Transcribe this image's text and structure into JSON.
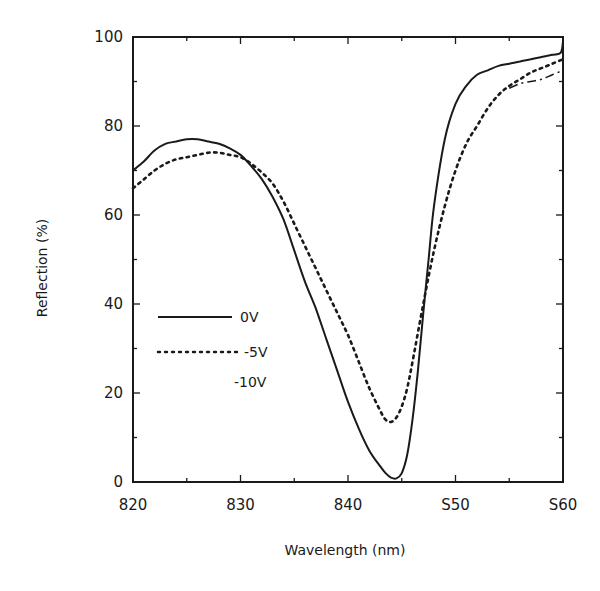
{
  "chart_data": {
    "type": "line",
    "title": "",
    "xlabel": "Wavelength (nm)",
    "ylabel": "Reflection (%)",
    "xlim": [
      820,
      860
    ],
    "ylim": [
      0,
      100
    ],
    "grid": false,
    "legend_position": "inside-left-middle",
    "x_ticks": [
      820,
      830,
      840,
      850,
      860
    ],
    "x_tick_labels": [
      "820",
      "830",
      "840",
      "S50",
      "S60"
    ],
    "y_ticks": [
      0,
      20,
      40,
      60,
      80,
      100
    ],
    "y_tick_labels": [
      "0",
      "20",
      "40",
      "60",
      "80",
      "100"
    ],
    "series": [
      {
        "name": "0V",
        "style": "solid",
        "x": [
          820,
          821,
          822,
          823,
          824,
          825,
          826,
          827,
          828,
          829,
          830,
          831,
          832,
          833,
          834,
          835,
          836,
          837,
          838,
          839,
          840,
          841,
          842,
          843,
          843.5,
          844,
          844.5,
          845,
          845.5,
          846,
          846.5,
          847,
          847.5,
          848,
          849,
          850,
          851,
          852,
          853,
          854,
          855,
          856,
          857,
          858,
          859,
          859.8,
          860
        ],
        "values": [
          70,
          72,
          74.5,
          76,
          76.5,
          77,
          77,
          76.5,
          76,
          75,
          73.5,
          71,
          68,
          64,
          59,
          52,
          45,
          39,
          32,
          25,
          18,
          12,
          7,
          3.5,
          2,
          1,
          0.8,
          2,
          6,
          14,
          25,
          38,
          50,
          62,
          77,
          85,
          89,
          91.5,
          92.5,
          93.5,
          94,
          94.5,
          95,
          95.5,
          96,
          96.5,
          99
        ]
      },
      {
        "name": "-5V",
        "style": "dotted",
        "x": [
          820,
          821,
          822,
          823,
          824,
          825,
          826,
          827,
          828,
          829,
          830,
          831,
          832,
          833,
          834,
          835,
          836,
          837,
          838,
          839,
          840,
          841,
          842,
          843,
          843.5,
          844,
          844.5,
          845,
          845.5,
          846,
          847,
          848,
          849,
          850,
          851,
          852,
          853,
          854,
          855,
          856,
          857,
          858,
          859,
          860
        ],
        "values": [
          66,
          68,
          70,
          71.5,
          72.5,
          73,
          73.5,
          74,
          74,
          73.5,
          73,
          71.5,
          69.5,
          67,
          63,
          58,
          53,
          48,
          43,
          38,
          33,
          27,
          21,
          16,
          14,
          13.5,
          14.5,
          17,
          21,
          27,
          40,
          52,
          62,
          70,
          76,
          80,
          84,
          87,
          89,
          90.5,
          92,
          93,
          94,
          95
        ]
      },
      {
        "name": "-10V",
        "style": "dash-dot",
        "x": [
          855,
          856,
          857,
          858,
          859,
          860
        ],
        "values": [
          88.5,
          89.5,
          90,
          90.5,
          91.5,
          92.5
        ]
      }
    ],
    "legend": [
      {
        "label": "0V",
        "style": "solid"
      },
      {
        "label": "-5V",
        "style": "dotted"
      },
      {
        "label": "-10V",
        "style": "none"
      }
    ]
  },
  "axes": {
    "xlabel": "Wavelength (nm)",
    "ylabel": "Reflection (%)"
  }
}
